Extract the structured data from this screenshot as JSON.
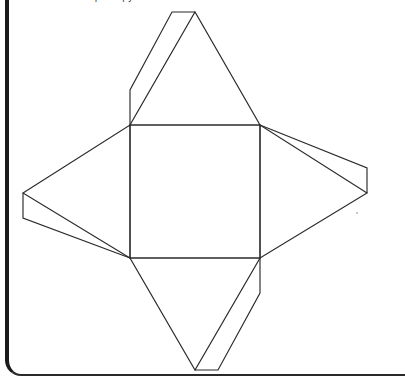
{
  "page": {
    "background_color": "#ffffff",
    "width": 383,
    "height": 387,
    "clipped_header_text": "the net of a square pyramid"
  },
  "frame": {
    "name": "worksheet-panel",
    "left_border_color": "#1b1b1b",
    "bottom_border_color": "#2a2a2a",
    "corner_radius_label": "16px"
  },
  "diagram": {
    "title": "Net of a square pyramid",
    "figure_type": "geometric-net",
    "line_color": "#2b2b2b",
    "fill_color": "#ffffff",
    "line_width": 1.15,
    "parts": [
      {
        "id": "base",
        "label": "square base",
        "shape": "square"
      },
      {
        "id": "face-top",
        "label": "top triangular face",
        "shape": "isosceles-triangle"
      },
      {
        "id": "face-right",
        "label": "right triangular face",
        "shape": "isosceles-triangle"
      },
      {
        "id": "face-bottom",
        "label": "bottom triangular face",
        "shape": "isosceles-triangle"
      },
      {
        "id": "face-left",
        "label": "left triangular face",
        "shape": "isosceles-triangle"
      },
      {
        "id": "tab-top",
        "label": "top glue tab",
        "shape": "narrow-quadrilateral"
      },
      {
        "id": "tab-right",
        "label": "right glue tab",
        "shape": "narrow-quadrilateral"
      },
      {
        "id": "tab-bottom",
        "label": "bottom glue tab",
        "shape": "narrow-quadrilateral"
      },
      {
        "id": "tab-left",
        "label": "left glue tab",
        "shape": "narrow-quadrilateral"
      }
    ],
    "geometry": {
      "base_square": [
        [
          130,
          125
        ],
        [
          260,
          125
        ],
        [
          260,
          258
        ],
        [
          130,
          258
        ]
      ],
      "face_top": [
        [
          130,
          125
        ],
        [
          260,
          125
        ],
        [
          195,
          12
        ]
      ],
      "face_right": [
        [
          260,
          125
        ],
        [
          260,
          258
        ],
        [
          367,
          193
        ]
      ],
      "face_bottom": [
        [
          130,
          258
        ],
        [
          260,
          258
        ],
        [
          195,
          370
        ]
      ],
      "face_left": [
        [
          130,
          125
        ],
        [
          130,
          258
        ],
        [
          23,
          193
        ]
      ],
      "tab_top": [
        [
          195,
          12
        ],
        [
          172,
          12
        ],
        [
          130,
          90
        ],
        [
          130,
          125
        ]
      ],
      "tab_right": [
        [
          367,
          193
        ],
        [
          367,
          168
        ],
        [
          260,
          125
        ]
      ],
      "tab_bottom": [
        [
          195,
          370
        ],
        [
          218,
          370
        ],
        [
          260,
          293
        ],
        [
          260,
          258
        ]
      ],
      "tab_left": [
        [
          23,
          193
        ],
        [
          23,
          218
        ],
        [
          130,
          258
        ]
      ]
    }
  }
}
